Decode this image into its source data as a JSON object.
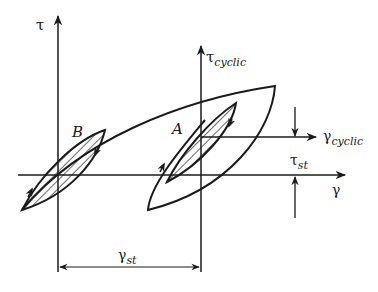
{
  "diagram": {
    "axes": {
      "tau_label": "τ",
      "gamma_label": "γ",
      "tau_cyclic_main": "τ",
      "tau_cyclic_sub": "cyclic",
      "gamma_cyclic_main": "γ",
      "gamma_cyclic_sub": "cyclic"
    },
    "annotations": {
      "tau_st_main": "τ",
      "tau_st_sub": "st",
      "gamma_st_main": "γ",
      "gamma_st_sub": "st"
    },
    "points": {
      "A": "A",
      "B": "B"
    },
    "colors": {
      "stroke": "#1a1a1a",
      "background": "#ffffff"
    }
  }
}
